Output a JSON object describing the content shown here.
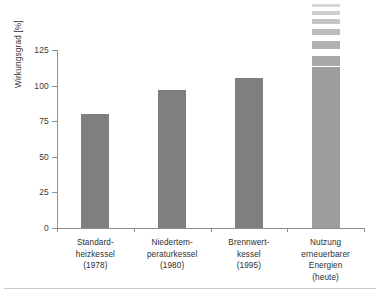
{
  "chart_data": {
    "type": "bar",
    "title": "",
    "xlabel": "",
    "ylabel": "Wirkungsgrad [%]",
    "ylim": [
      0,
      125
    ],
    "yticks": [
      0,
      25,
      50,
      75,
      100,
      125
    ],
    "ytick_labels": [
      "0",
      "25",
      "50",
      "75",
      "100",
      "125"
    ],
    "grid": false,
    "legend": "none",
    "categories": [
      "Standard-\nheizkessel\n(1978)",
      "Niedertem-\nperaturkessel\n(1980)",
      "Brennwert-\nkessel\n(1995)",
      "Nutzung\nerneuerbarer\nEnergien\n(heute)"
    ],
    "values": [
      80,
      97,
      105,
      113
    ],
    "bars": [
      {
        "label_lines": [
          "Standard-",
          "heizkessel",
          "(1978)"
        ],
        "value": 80,
        "color": "#807f7f",
        "continues_above": false
      },
      {
        "label_lines": [
          "Niedertem-",
          "peraturkessel",
          "(1980)"
        ],
        "value": 97,
        "color": "#807f7f",
        "continues_above": false
      },
      {
        "label_lines": [
          "Brennwert-",
          "kessel",
          "(1995)"
        ],
        "value": 105,
        "color": "#807f7f",
        "continues_above": false
      },
      {
        "label_lines": [
          "Nutzung",
          "erneuerbarer",
          "Energien",
          "(heute)"
        ],
        "value": 113,
        "color": "#9d9d9d",
        "continues_above": true
      }
    ],
    "fade_segments": [
      {
        "top_px": 4,
        "height_px": 3,
        "color": "#d7d7d7"
      },
      {
        "top_px": 11,
        "height_px": 4,
        "color": "#cfcfcf"
      },
      {
        "top_px": 19,
        "height_px": 5,
        "color": "#c4c4c4"
      },
      {
        "top_px": 29,
        "height_px": 6,
        "color": "#bcbcbc"
      },
      {
        "top_px": 41,
        "height_px": 8,
        "color": "#b2b2b2"
      },
      {
        "top_px": 56,
        "height_px": 10,
        "color": "#a8a8a8"
      }
    ],
    "colors": {
      "bar_dark": "#807f7f",
      "bar_light": "#9d9d9d",
      "axis": "#8f8f8f",
      "text": "#2e2e2e",
      "background": "#ffffff",
      "footer_rule": "#c9c9c9"
    }
  }
}
